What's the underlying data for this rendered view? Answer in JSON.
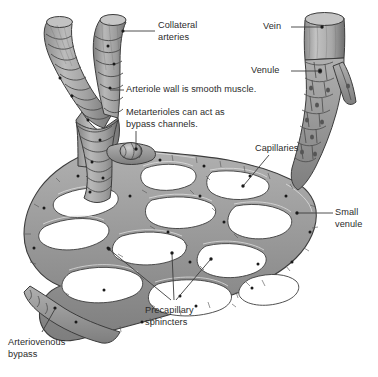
{
  "figure": {
    "type": "anatomical-illustration",
    "background_color": "#ffffff",
    "palette": {
      "vessel_fill": "#9a9a9a",
      "vessel_fill_light": "#b5b5b5",
      "vessel_fill_dark": "#7d7d7d",
      "outline": "#3c3c3c",
      "lumen": "#ffffff",
      "text": "#2b2b2b",
      "leader_line": "#3c3c3c",
      "dot": "#1a1a1a"
    }
  },
  "labels": [
    {
      "id": "collateral-arteries",
      "text": "Collateral\narteries",
      "x": 158,
      "y": 20,
      "align": "left",
      "leader": {
        "from": [
          155,
          31
        ],
        "to": [
          123,
          31
        ]
      },
      "dot": [
        123,
        31
      ]
    },
    {
      "id": "vein",
      "text": "Vein",
      "x": 263,
      "y": 21,
      "align": "left",
      "leader": {
        "from": [
          291,
          27
        ],
        "to": [
          322,
          27
        ]
      },
      "dot": [
        322,
        27
      ]
    },
    {
      "id": "venule",
      "text": "Venule",
      "x": 251,
      "y": 65,
      "align": "left",
      "leader": {
        "from": [
          291,
          71
        ],
        "to": [
          320,
          71
        ]
      },
      "dot": [
        320,
        71
      ]
    },
    {
      "id": "arteriole-wall",
      "text": "Arteriole wall is smooth muscle.",
      "x": 126,
      "y": 84,
      "align": "left",
      "leader": {
        "from": [
          124,
          90
        ],
        "to": [
          110,
          90
        ]
      },
      "dot": null
    },
    {
      "id": "metarterioles",
      "text": "Metarterioles can act as\nbypass channels.",
      "x": 126,
      "y": 107,
      "align": "left",
      "leader": {
        "from": [
          136,
          131
        ],
        "to": [
          136,
          149
        ]
      },
      "dot": [
        136,
        149
      ]
    },
    {
      "id": "capillaries",
      "text": "Capillaries",
      "x": 255,
      "y": 143,
      "align": "left",
      "leader": {
        "from": [
          269,
          155
        ],
        "to": [
          243,
          186
        ]
      },
      "dot": [
        243,
        186
      ]
    },
    {
      "id": "small-venule",
      "text": "Small\nvenule",
      "x": 335,
      "y": 207,
      "align": "left",
      "leader": {
        "from": [
          333,
          213
        ],
        "to": [
          297,
          213
        ]
      },
      "dot": [
        297,
        213
      ]
    },
    {
      "id": "precapillary-sphincters",
      "text": "Precapillary\nsphincters",
      "x": 145,
      "y": 305,
      "align": "left",
      "leaders": [
        {
          "from": [
            171,
            303
          ],
          "to": [
            109,
            249
          ]
        },
        {
          "from": [
            174,
            303
          ],
          "to": [
            172,
            253
          ]
        },
        {
          "from": [
            176,
            303
          ],
          "to": [
            211,
            259
          ]
        }
      ]
    },
    {
      "id": "arteriovenous-bypass",
      "text": "Arteriovenous\nbypass",
      "x": 8,
      "y": 337,
      "align": "left",
      "leader": {
        "from": [
          42,
          334
        ],
        "to": [
          55,
          308
        ]
      },
      "dot": [
        55,
        308
      ]
    }
  ],
  "structures": [
    {
      "id": "collateral-artery-left",
      "name": "Collateral artery (left branch)"
    },
    {
      "id": "collateral-artery-right",
      "name": "Collateral artery (right branch)"
    },
    {
      "id": "arteriole-trunk",
      "name": "Arteriole with smooth muscle rings"
    },
    {
      "id": "metarteriole",
      "name": "Metarteriole bypass channel"
    },
    {
      "id": "capillary-bed",
      "name": "Capillary network"
    },
    {
      "id": "precapillary-sphincter",
      "name": "Precapillary sphincter"
    },
    {
      "id": "small-venule",
      "name": "Small venule"
    },
    {
      "id": "venule",
      "name": "Venule with endothelial cells"
    },
    {
      "id": "vein",
      "name": "Vein"
    },
    {
      "id": "arteriovenous-bypass",
      "name": "Arteriovenous bypass"
    }
  ]
}
